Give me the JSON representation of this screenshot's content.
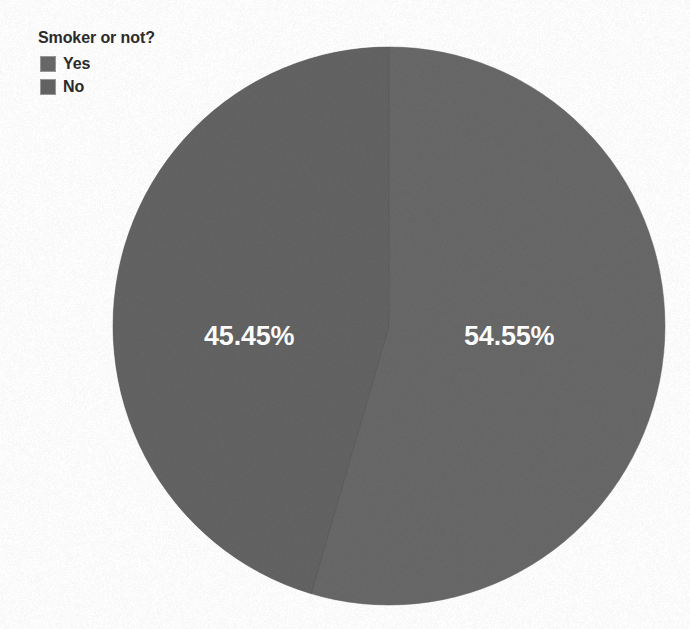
{
  "legend": {
    "title": "Smoker or not?",
    "items": [
      {
        "label": "Yes",
        "color": "#686868"
      },
      {
        "label": "No",
        "color": "#636363"
      }
    ]
  },
  "labels": {
    "yes": "54.55%",
    "no": "45.45%"
  },
  "chart_data": {
    "type": "pie",
    "title": "Smoker or not?",
    "categories": [
      "Yes",
      "No"
    ],
    "values": [
      54.55,
      45.45
    ],
    "value_labels": [
      "54.55%",
      "45.45%"
    ],
    "colors": [
      "#686868",
      "#636363"
    ],
    "legend_position": "top-left",
    "start_angle_deg": 0,
    "direction": "clockwise",
    "grid": false,
    "xlabel": "",
    "ylabel": ""
  },
  "geometry": {
    "center_x": 389,
    "center_y": 326,
    "radius_x": 276,
    "radius_y": 279
  }
}
